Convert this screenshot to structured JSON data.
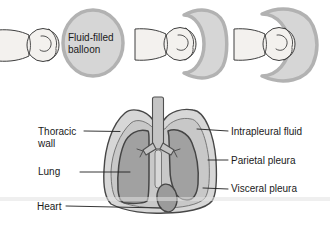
{
  "diagram": {
    "balloon_label": "Fluid-filled balloon",
    "anatomy_labels": {
      "thoracic_wall": "Thoracic wall",
      "lung": "Lung",
      "heart": "Heart",
      "intrapleural_fluid": "Intrapleural fluid",
      "parietal_pleura": "Parietal pleura",
      "visceral_pleura": "Visceral pleura"
    },
    "colors": {
      "background": "#ffffff",
      "balloon_fill": "#d6d6d6",
      "balloon_border": "#b2b2b2",
      "skin_fill": "#f3f1ee",
      "outline_dark": "#474747",
      "thoracic_wall_fill": "#d7d7d7",
      "pleural_space_fill": "#c8c8c8",
      "lung_fill": "#a1a1a1",
      "heart_fill": "#9b9b9b",
      "trachea_fill": "#c4c4c4",
      "label_text": "#1a1a1a"
    }
  }
}
